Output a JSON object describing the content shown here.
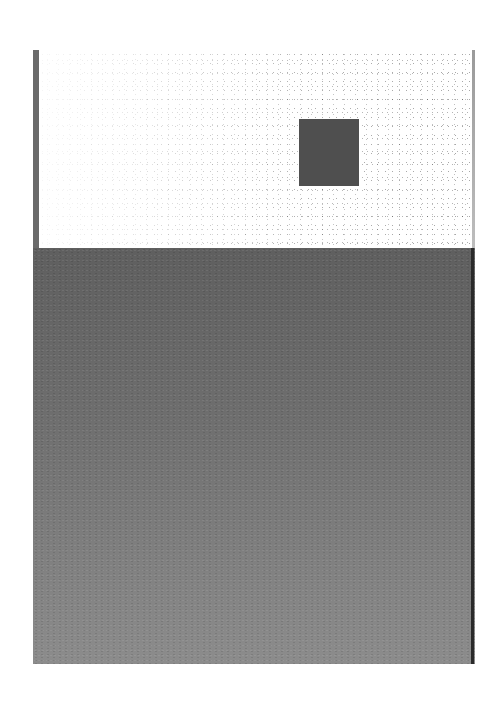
{
  "scene": {
    "description": "Scanned printed page with a speckled white top panel containing a dark square, and a large gray field below",
    "colors": {
      "page_background": "#ffffff",
      "left_bar": "#6a6a6a",
      "dark_square": "#4f4f4f",
      "bottom_field_top": "#5f5f5f",
      "bottom_field_bottom": "#8c8c8c"
    }
  }
}
